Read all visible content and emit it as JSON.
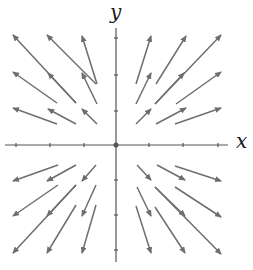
{
  "diagram": {
    "title": "",
    "type": "vector-field",
    "axes": {
      "x_label": "x",
      "y_label": "y",
      "origin_px": [
        116,
        145
      ],
      "x_axis_px": [
        5,
        228
      ],
      "y_axis_px": [
        28,
        262
      ],
      "x_ticks_px": [
        16,
        50,
        84,
        116,
        149,
        183,
        218
      ],
      "y_ticks_px": [
        38,
        75,
        111,
        145,
        180,
        215,
        250
      ]
    },
    "colors": {
      "arrow": "#6e6e6e",
      "axis": "#555555",
      "label": "#1a1a1a",
      "background": "#ffffff"
    },
    "arrows": [
      {
        "grid": [
          -3,
          3
        ],
        "tail": [
          76,
          103
        ],
        "head": [
          13,
          35
        ]
      },
      {
        "grid": [
          -2,
          3
        ],
        "tail": [
          96,
          84
        ],
        "head": [
          47,
          35
        ]
      },
      {
        "grid": [
          -1,
          3
        ],
        "tail": [
          97,
          84
        ],
        "head": [
          82,
          36
        ]
      },
      {
        "grid": [
          -3,
          2
        ],
        "tail": [
          57,
          103
        ],
        "head": [
          13,
          72
        ]
      },
      {
        "grid": [
          -2,
          2
        ],
        "tail": [
          76,
          103
        ],
        "head": [
          48,
          73
        ]
      },
      {
        "grid": [
          -1,
          2
        ],
        "tail": [
          97,
          104
        ],
        "head": [
          82,
          73
        ]
      },
      {
        "grid": [
          -3,
          1
        ],
        "tail": [
          57,
          124
        ],
        "head": [
          13,
          108
        ]
      },
      {
        "grid": [
          -2,
          1
        ],
        "tail": [
          76,
          124
        ],
        "head": [
          48,
          109
        ]
      },
      {
        "grid": [
          -1,
          1
        ],
        "tail": [
          97,
          124
        ],
        "head": [
          82,
          109
        ]
      },
      {
        "grid": [
          1,
          3
        ],
        "tail": [
          136,
          84
        ],
        "head": [
          151,
          36
        ]
      },
      {
        "grid": [
          2,
          3
        ],
        "tail": [
          156,
          84
        ],
        "head": [
          186,
          36
        ]
      },
      {
        "grid": [
          3,
          3
        ],
        "tail": [
          155,
          104
        ],
        "head": [
          221,
          35
        ]
      },
      {
        "grid": [
          1,
          2
        ],
        "tail": [
          136,
          104
        ],
        "head": [
          151,
          73
        ]
      },
      {
        "grid": [
          2,
          2
        ],
        "tail": [
          155,
          104
        ],
        "head": [
          184,
          73
        ]
      },
      {
        "grid": [
          3,
          2
        ],
        "tail": [
          176,
          104
        ],
        "head": [
          221,
          72
        ]
      },
      {
        "grid": [
          1,
          1
        ],
        "tail": [
          136,
          124
        ],
        "head": [
          151,
          109
        ]
      },
      {
        "grid": [
          2,
          1
        ],
        "tail": [
          156,
          124
        ],
        "head": [
          186,
          108
        ]
      },
      {
        "grid": [
          3,
          1
        ],
        "tail": [
          175,
          124
        ],
        "head": [
          221,
          108
        ]
      },
      {
        "grid": [
          -3,
          -1
        ],
        "tail": [
          58,
          165
        ],
        "head": [
          13,
          181
        ]
      },
      {
        "grid": [
          -2,
          -1
        ],
        "tail": [
          76,
          165
        ],
        "head": [
          47,
          181
        ]
      },
      {
        "grid": [
          -1,
          -1
        ],
        "tail": [
          96,
          165
        ],
        "head": [
          82,
          181
        ]
      },
      {
        "grid": [
          -3,
          -2
        ],
        "tail": [
          58,
          185
        ],
        "head": [
          13,
          216
        ]
      },
      {
        "grid": [
          -2,
          -2
        ],
        "tail": [
          76,
          185
        ],
        "head": [
          47,
          216
        ]
      },
      {
        "grid": [
          -1,
          -2
        ],
        "tail": [
          96,
          185
        ],
        "head": [
          82,
          216
        ]
      },
      {
        "grid": [
          -3,
          -3
        ],
        "tail": [
          76,
          185
        ],
        "head": [
          13,
          253
        ]
      },
      {
        "grid": [
          -2,
          -3
        ],
        "tail": [
          76,
          205
        ],
        "head": [
          47,
          253
        ]
      },
      {
        "grid": [
          -1,
          -3
        ],
        "tail": [
          96,
          205
        ],
        "head": [
          82,
          253
        ]
      },
      {
        "grid": [
          1,
          -1
        ],
        "tail": [
          137,
          165
        ],
        "head": [
          151,
          180
        ]
      },
      {
        "grid": [
          2,
          -1
        ],
        "tail": [
          157,
          165
        ],
        "head": [
          185,
          180
        ]
      },
      {
        "grid": [
          3,
          -1
        ],
        "tail": [
          175,
          166
        ],
        "head": [
          221,
          181
        ]
      },
      {
        "grid": [
          1,
          -2
        ],
        "tail": [
          137,
          187
        ],
        "head": [
          151,
          216
        ]
      },
      {
        "grid": [
          2,
          -2
        ],
        "tail": [
          155,
          187
        ],
        "head": [
          185,
          216
        ]
      },
      {
        "grid": [
          3,
          -2
        ],
        "tail": [
          175,
          187
        ],
        "head": [
          221,
          217
        ]
      },
      {
        "grid": [
          1,
          -3
        ],
        "tail": [
          136,
          206
        ],
        "head": [
          151,
          253
        ]
      },
      {
        "grid": [
          2,
          -3
        ],
        "tail": [
          155,
          207
        ],
        "head": [
          185,
          253
        ]
      },
      {
        "grid": [
          3,
          -3
        ],
        "tail": [
          155,
          187
        ],
        "head": [
          221,
          254
        ]
      }
    ]
  }
}
